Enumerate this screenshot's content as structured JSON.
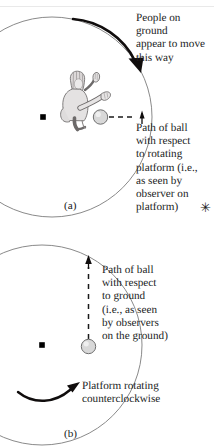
{
  "figure": {
    "panels": [
      {
        "id": "a",
        "label": "(a)",
        "annotations": {
          "rotation_note": "People on ground\nappear to move\nthis way",
          "path_note": "Path of ball\nwith respect\nto rotating\nplatform (i.e.,\nas seen by\nobserver on\nplatform)",
          "footnote_mark": "✳"
        },
        "icons": {
          "center_dot": "center-dot-icon",
          "person": "seated-person-kicking-icon",
          "ball": "ball-icon",
          "platform_arc": "platform-circle-arc-icon",
          "curved_arrow": "curved-arrow-clockwise-icon",
          "dashed_path": "dashed-straight-path-icon",
          "path_arrowhead": "arrowhead-icon"
        },
        "colors": {
          "arc": "#8a8a8a",
          "arrow": "#100d0d",
          "dash": "#1a1a1a",
          "ball_fill": "#d8d8d8",
          "ball_stroke": "#6f6f6f",
          "dot": "#000000",
          "text": "#201c1c"
        }
      },
      {
        "id": "b",
        "label": "(b)",
        "annotations": {
          "path_note": "Path of ball\nwith respect\nto ground\n(i.e., as seen\nby observers\non the ground)",
          "rotation_note": "Platform rotating\ncounterclockwise"
        },
        "icons": {
          "center_dot": "center-dot-icon",
          "ball": "ball-icon",
          "platform_arc": "platform-circle-arc-icon",
          "curved_arrow": "curved-arrow-counterclockwise-icon",
          "dashed_path": "dashed-vertical-path-icon",
          "path_arrowhead": "arrowhead-icon"
        },
        "colors": {
          "arc": "#8a8a8a",
          "arrow": "#100d0d",
          "dash": "#1a1a1a",
          "ball_fill": "#d8d8d8",
          "ball_stroke": "#6f6f6f",
          "dot": "#000000",
          "text": "#201c1c"
        }
      }
    ]
  }
}
